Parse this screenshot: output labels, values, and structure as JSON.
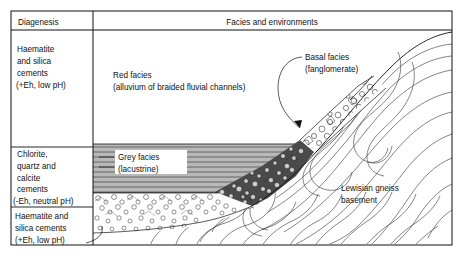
{
  "figure": {
    "kind": "geological-cross-section",
    "frame": {
      "x": 11,
      "y": 11,
      "width": 441,
      "height": 234
    },
    "column_divider_x": 93,
    "header_row_bottom_y": 30
  },
  "header": {
    "left_column": "Diagenesis",
    "right_column": "Facies and environments"
  },
  "diagenesis_zones": [
    {
      "id": "zone-upper",
      "lines": [
        "Haematite",
        "and  silica",
        "cements",
        "(+Eh, low pH)"
      ],
      "top_y": 30,
      "bottom_y": 147
    },
    {
      "id": "zone-middle",
      "lines": [
        "Chlorite,",
        "quartz and",
        "calcite",
        "cements",
        "(-Eh, neutral pH)"
      ],
      "top_y": 147,
      "bottom_y": 207
    },
    {
      "id": "zone-lower",
      "lines": [
        "Haematite and",
        "silica cements",
        "(+Eh, low pH)"
      ],
      "top_y": 207,
      "bottom_y": 245
    }
  ],
  "facies_labels": [
    {
      "id": "red-facies",
      "lines": [
        "Red facies",
        "(alluvium of braided fluvial channels)"
      ],
      "x": 113,
      "y": 75
    },
    {
      "id": "basal-facies",
      "lines": [
        "Basal facies",
        "(fanglomerate)"
      ],
      "x": 305,
      "y": 57
    },
    {
      "id": "grey-facies",
      "lines": [
        "Grey facies",
        "(lacustrine)"
      ],
      "x": 119,
      "y": 160
    },
    {
      "id": "lewisian-gneiss",
      "lines": [
        "Lewisian gneiss",
        "basement"
      ],
      "x": 341,
      "y": 188
    }
  ],
  "colors": {
    "ink": "#111111",
    "grey_facies_fill": "#b9b9b9",
    "conglomerate_dark": "#3d3d3d",
    "paper": "#ffffff"
  },
  "patterns": [
    {
      "name": "grey-facies-hatch",
      "desc": "horizontal ruled lines on grey fill, lacustrine"
    },
    {
      "name": "fanglomerate-clasts",
      "desc": "open angular pebble outlines, basal facies"
    },
    {
      "name": "dark-conglomerate",
      "desc": "dense dark clast mass along the fan wedge"
    },
    {
      "name": "breccia-stipple",
      "desc": "small irregular clasts in lowest unit"
    },
    {
      "name": "gneiss-foliation",
      "desc": "wavy folded foliation traces in basement"
    }
  ]
}
